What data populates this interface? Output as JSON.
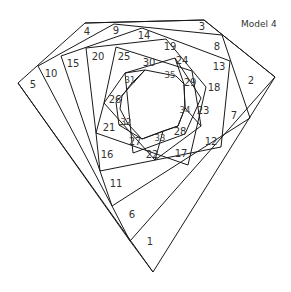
{
  "title": "Model 4",
  "colors": {
    "line": "#1a1a1a",
    "text": "#333333",
    "background": "#ffffff"
  },
  "labels": [
    {
      "n": "1",
      "x": 150,
      "y": 242
    },
    {
      "n": "2",
      "x": 251,
      "y": 81
    },
    {
      "n": "3",
      "x": 202,
      "y": 27
    },
    {
      "n": "4",
      "x": 87,
      "y": 32
    },
    {
      "n": "5",
      "x": 33,
      "y": 85
    },
    {
      "n": "6",
      "x": 132,
      "y": 215
    },
    {
      "n": "7",
      "x": 234,
      "y": 116
    },
    {
      "n": "8",
      "x": 217,
      "y": 47
    },
    {
      "n": "9",
      "x": 116,
      "y": 31
    },
    {
      "n": "10",
      "x": 51,
      "y": 74
    },
    {
      "n": "11",
      "x": 116,
      "y": 184
    },
    {
      "n": "12",
      "x": 211,
      "y": 142
    },
    {
      "n": "13",
      "x": 219,
      "y": 67
    },
    {
      "n": "14",
      "x": 144,
      "y": 36
    },
    {
      "n": "15",
      "x": 73,
      "y": 64
    },
    {
      "n": "16",
      "x": 107,
      "y": 155
    },
    {
      "n": "17",
      "x": 181,
      "y": 154
    },
    {
      "n": "18",
      "x": 214,
      "y": 88
    },
    {
      "n": "19",
      "x": 170,
      "y": 47
    },
    {
      "n": "20",
      "x": 98,
      "y": 57
    },
    {
      "n": "21",
      "x": 109,
      "y": 128
    },
    {
      "n": "22",
      "x": 152,
      "y": 155
    },
    {
      "n": "23",
      "x": 203,
      "y": 111
    },
    {
      "n": "24",
      "x": 182,
      "y": 61
    },
    {
      "n": "25",
      "x": 124,
      "y": 57
    },
    {
      "n": "26",
      "x": 115,
      "y": 100
    },
    {
      "n": "27",
      "x": 135,
      "y": 142
    },
    {
      "n": "28",
      "x": 180,
      "y": 132
    },
    {
      "n": "29",
      "x": 190,
      "y": 83
    },
    {
      "n": "30",
      "x": 149,
      "y": 63
    },
    {
      "n": "31",
      "x": 130,
      "y": 80,
      "small": true
    },
    {
      "n": "32",
      "x": 126,
      "y": 122,
      "small": true
    },
    {
      "n": "33",
      "x": 160,
      "y": 138,
      "small": true
    },
    {
      "n": "34",
      "x": 185,
      "y": 110,
      "small": true
    },
    {
      "n": "35",
      "x": 170,
      "y": 75,
      "small": true
    }
  ]
}
